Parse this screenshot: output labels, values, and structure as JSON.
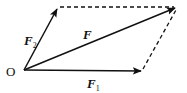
{
  "diagram": {
    "type": "vector-parallelogram",
    "colors": {
      "stroke": "#111111",
      "background": "#ffffff"
    },
    "origin": {
      "label": "O",
      "x": 24,
      "y": 70
    },
    "vectors": [
      {
        "id": "F1",
        "label": "F",
        "subscript": "1",
        "from": [
          24,
          70
        ],
        "to": [
          142,
          71
        ],
        "style": "solid-arrow"
      },
      {
        "id": "F2",
        "label": "F",
        "subscript": "2",
        "from": [
          24,
          70
        ],
        "to": [
          58,
          7
        ],
        "style": "solid-arrow"
      },
      {
        "id": "F",
        "label": "F",
        "subscript": "",
        "from": [
          24,
          70
        ],
        "to": [
          177,
          7
        ],
        "style": "solid-arrow"
      }
    ],
    "dashed_edges": [
      {
        "from": [
          58,
          7
        ],
        "to": [
          177,
          7
        ]
      },
      {
        "from": [
          142,
          71
        ],
        "to": [
          177,
          7
        ]
      }
    ]
  }
}
